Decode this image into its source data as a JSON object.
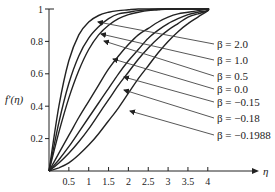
{
  "chart_data": {
    "type": "line",
    "title": "",
    "xlabel": "η",
    "ylabel": "f′(η)",
    "xlim": [
      0,
      5.2
    ],
    "ylim": [
      0,
      1
    ],
    "grid": false,
    "legend_position": "right, annotated with arrows",
    "x_ticks": [
      "0.5",
      "1",
      "1.5",
      "2",
      "2.5",
      "3",
      "3.5",
      "4"
    ],
    "y_ticks": [
      "0.2",
      "0.4",
      "0.6",
      "0.8",
      "1"
    ],
    "x": [
      0,
      0.25,
      0.5,
      0.75,
      1.0,
      1.25,
      1.5,
      1.75,
      2.0,
      2.25,
      2.5,
      2.75,
      3.0,
      3.25,
      3.5,
      3.75,
      4.0
    ],
    "series": [
      {
        "name": "β = 2.0",
        "beta": 2.0,
        "values": [
          0,
          0.4,
          0.68,
          0.84,
          0.92,
          0.96,
          0.98,
          0.99,
          0.995,
          1,
          1,
          1,
          1,
          1,
          1,
          1,
          1
        ]
      },
      {
        "name": "β = 1.0",
        "beta": 1.0,
        "values": [
          0,
          0.3,
          0.54,
          0.71,
          0.82,
          0.89,
          0.94,
          0.97,
          0.98,
          0.99,
          0.995,
          1,
          1,
          1,
          1,
          1,
          1
        ]
      },
      {
        "name": "β = 0.5",
        "beta": 0.5,
        "values": [
          0,
          0.24,
          0.45,
          0.62,
          0.75,
          0.84,
          0.9,
          0.94,
          0.965,
          0.98,
          0.99,
          0.995,
          1,
          1,
          1,
          1,
          1
        ]
      },
      {
        "name": "β = 0.0",
        "beta": 0.0,
        "values": [
          0,
          0.11,
          0.22,
          0.33,
          0.43,
          0.53,
          0.63,
          0.71,
          0.78,
          0.84,
          0.88,
          0.92,
          0.95,
          0.97,
          0.98,
          0.99,
          1
        ]
      },
      {
        "name": "β = -0.15",
        "beta": -0.15,
        "values": [
          0,
          0.07,
          0.15,
          0.24,
          0.33,
          0.42,
          0.51,
          0.6,
          0.68,
          0.75,
          0.82,
          0.87,
          0.91,
          0.94,
          0.965,
          0.98,
          0.99
        ]
      },
      {
        "name": "β = -0.18",
        "beta": -0.18,
        "values": [
          0,
          0.05,
          0.11,
          0.18,
          0.26,
          0.35,
          0.44,
          0.53,
          0.61,
          0.69,
          0.76,
          0.82,
          0.87,
          0.91,
          0.95,
          0.97,
          0.99
        ]
      },
      {
        "name": "β = -0.1988",
        "beta": -0.1988,
        "values": [
          0,
          0.02,
          0.05,
          0.1,
          0.16,
          0.23,
          0.31,
          0.39,
          0.48,
          0.57,
          0.65,
          0.73,
          0.8,
          0.86,
          0.91,
          0.95,
          0.99
        ]
      }
    ],
    "annotations": [
      "β = 2.0",
      "β = 1.0",
      "β = 0.5",
      "β = 0.0",
      "β = −0.15",
      "β = −0.18",
      "β = −0.1988"
    ]
  },
  "axes": {
    "y_title_main": "f′(η)",
    "x_title": "η",
    "y_ticks": [
      {
        "label": "1",
        "value": 1.0
      },
      {
        "label": "0.8",
        "value": 0.8
      },
      {
        "label": "0.6",
        "value": 0.6
      },
      {
        "label": "0.4",
        "value": 0.4
      },
      {
        "label": "0.2",
        "value": 0.2
      }
    ],
    "x_ticks": [
      {
        "label": "0.5",
        "value": 0.5
      },
      {
        "label": "1",
        "value": 1.0
      },
      {
        "label": "1.5",
        "value": 1.5
      },
      {
        "label": "2",
        "value": 2.0
      },
      {
        "label": "2.5",
        "value": 2.5
      },
      {
        "label": "3",
        "value": 3.0
      },
      {
        "label": "3.5",
        "value": 3.5
      },
      {
        "label": "4",
        "value": 4.0
      }
    ]
  },
  "labels": [
    {
      "text": "β = 2.0",
      "label_y": 47,
      "tip": [
        98,
        22
      ]
    },
    {
      "text": "β = 1.0",
      "label_y": 63,
      "tip": [
        101,
        34
      ]
    },
    {
      "text": "β = 0.5",
      "label_y": 79,
      "tip": [
        104,
        41
      ]
    },
    {
      "text": "β = 0.0",
      "label_y": 92,
      "tip": [
        113,
        59
      ]
    },
    {
      "text": "β = −0.15",
      "label_y": 105,
      "tip": [
        124,
        77
      ]
    },
    {
      "text": "β = −0.18",
      "label_y": 121,
      "tip": [
        124,
        90
      ]
    },
    {
      "text": "β = −0.1988",
      "label_y": 138,
      "tip": [
        130,
        111
      ]
    }
  ],
  "colors": {
    "line": "#222222",
    "leader": "#444444",
    "background": "#ffffff"
  }
}
